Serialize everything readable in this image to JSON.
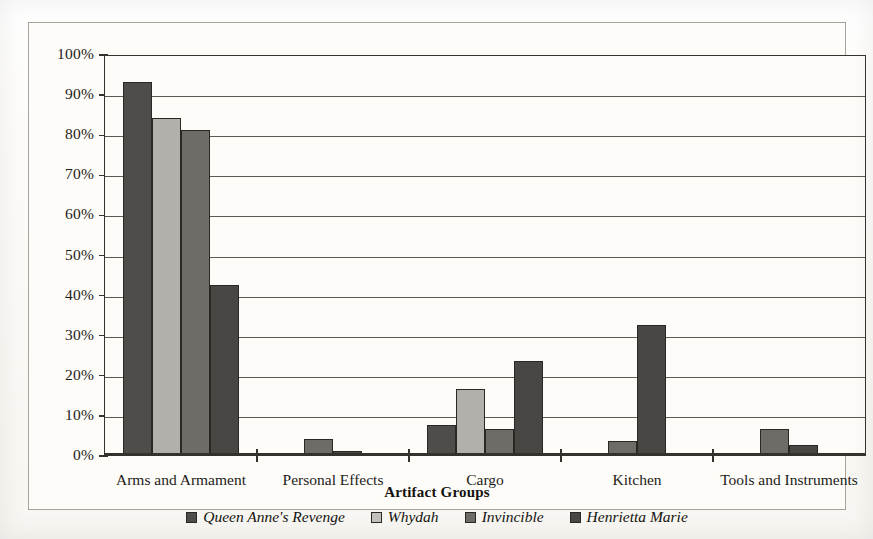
{
  "chart_data": {
    "type": "bar",
    "title": "",
    "xlabel": "Artifact Groups",
    "ylabel": "",
    "ylim": [
      0,
      100
    ],
    "grid": true,
    "legend_position": "bottom",
    "categories": [
      "Arms and Armament",
      "Personal Effects",
      "Cargo",
      "Kitchen",
      "Tools and Instruments"
    ],
    "ytick_labels": [
      "100%",
      "90%",
      "80%",
      "70%",
      "60%",
      "50%",
      "40%",
      "30%",
      "20%",
      "10%",
      "0%"
    ],
    "ytick_values": [
      100,
      90,
      80,
      70,
      60,
      50,
      40,
      30,
      20,
      10,
      0
    ],
    "series": [
      {
        "name": "Queen Anne's Revenge",
        "color": "#4f4d49",
        "values": [
          93,
          0,
          7.5,
          0,
          0
        ]
      },
      {
        "name": "Whydah",
        "color": "#b2b0ab",
        "values": [
          84,
          0,
          16.5,
          0,
          0
        ]
      },
      {
        "name": "Invincible",
        "color": "#6e6c67",
        "values": [
          81,
          4,
          6.5,
          3.5,
          6.5
        ]
      },
      {
        "name": "Henrietta Marie",
        "color": "#494743",
        "values": [
          42.5,
          1,
          23.5,
          32.5,
          2.5
        ]
      }
    ]
  }
}
